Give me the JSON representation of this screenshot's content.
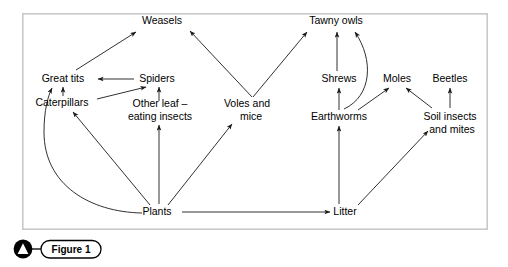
{
  "figure": {
    "caption_label": "Figure 1",
    "caption_icon": "triangle-marker-icon",
    "border_color": "#c8c8c8",
    "line_color": "#1a1a1a",
    "background_color": "#ffffff"
  },
  "panel": {
    "x": 22,
    "y": 13,
    "width": 466,
    "height": 217
  },
  "diagram": {
    "type": "food-web",
    "nodes": [
      {
        "id": "weasels",
        "label": "Weasels",
        "x": 162,
        "y": 21,
        "lines": [
          "Weasels"
        ]
      },
      {
        "id": "tawny",
        "label": "Tawny owls",
        "x": 336,
        "y": 21,
        "lines": [
          "Tawny owls"
        ]
      },
      {
        "id": "greattits",
        "label": "Great tits",
        "x": 63,
        "y": 79,
        "lines": [
          "Great tits"
        ]
      },
      {
        "id": "spiders",
        "label": "Spiders",
        "x": 157,
        "y": 79,
        "lines": [
          "Spiders"
        ]
      },
      {
        "id": "shrews",
        "label": "Shrews",
        "x": 339,
        "y": 79,
        "lines": [
          "Shrews"
        ]
      },
      {
        "id": "moles",
        "label": "Moles",
        "x": 397,
        "y": 79,
        "lines": [
          "Moles"
        ]
      },
      {
        "id": "beetles",
        "label": "Beetles",
        "x": 450,
        "y": 79,
        "lines": [
          "Beetles"
        ]
      },
      {
        "id": "caterpillars",
        "label": "Caterpillars",
        "x": 62,
        "y": 103,
        "lines": [
          "Caterpillars"
        ]
      },
      {
        "id": "otherleaf",
        "label": "Other leaf - eating insects",
        "x": 160,
        "y": 110,
        "lines": [
          "Other leaf –",
          "eating insects"
        ]
      },
      {
        "id": "voles",
        "label": "Voles and mice",
        "x": 247,
        "y": 110,
        "lines": [
          "Voles and",
          "mice"
        ]
      },
      {
        "id": "earthworms",
        "label": "Earthworms",
        "x": 339,
        "y": 117,
        "lines": [
          "Earthworms"
        ]
      },
      {
        "id": "soilinsects",
        "label": "Soil insects and mites",
        "x": 450,
        "y": 117,
        "lines": [
          "Soil insects",
          "and mites"
        ]
      },
      {
        "id": "plants",
        "label": "Plants",
        "x": 157,
        "y": 212,
        "lines": [
          "Plants"
        ]
      },
      {
        "id": "litter",
        "label": "Litter",
        "x": 345,
        "y": 212,
        "lines": [
          "Litter"
        ]
      }
    ],
    "edges": [
      {
        "from": "greattits",
        "to": "weasels",
        "shape": "straight"
      },
      {
        "from": "voles",
        "to": "weasels",
        "shape": "straight"
      },
      {
        "from": "voles",
        "to": "tawny",
        "shape": "straight"
      },
      {
        "from": "shrews",
        "to": "tawny",
        "shape": "straight"
      },
      {
        "from": "earthworms",
        "to": "tawny",
        "shape": "curved"
      },
      {
        "from": "spiders",
        "to": "greattits",
        "shape": "straight"
      },
      {
        "from": "caterpillars",
        "to": "greattits",
        "shape": "straight"
      },
      {
        "from": "caterpillars",
        "to": "spiders",
        "shape": "straight"
      },
      {
        "from": "otherleaf",
        "to": "spiders",
        "shape": "straight"
      },
      {
        "from": "earthworms",
        "to": "shrews",
        "shape": "straight"
      },
      {
        "from": "earthworms",
        "to": "moles",
        "shape": "straight"
      },
      {
        "from": "soilinsects",
        "to": "moles",
        "shape": "straight"
      },
      {
        "from": "soilinsects",
        "to": "beetles",
        "shape": "straight"
      },
      {
        "from": "plants",
        "to": "greattits",
        "shape": "curved"
      },
      {
        "from": "plants",
        "to": "caterpillars",
        "shape": "straight"
      },
      {
        "from": "plants",
        "to": "otherleaf",
        "shape": "straight"
      },
      {
        "from": "plants",
        "to": "voles",
        "shape": "straight"
      },
      {
        "from": "plants",
        "to": "litter",
        "shape": "straight"
      },
      {
        "from": "litter",
        "to": "earthworms",
        "shape": "straight"
      },
      {
        "from": "litter",
        "to": "soilinsects",
        "shape": "straight"
      }
    ]
  }
}
